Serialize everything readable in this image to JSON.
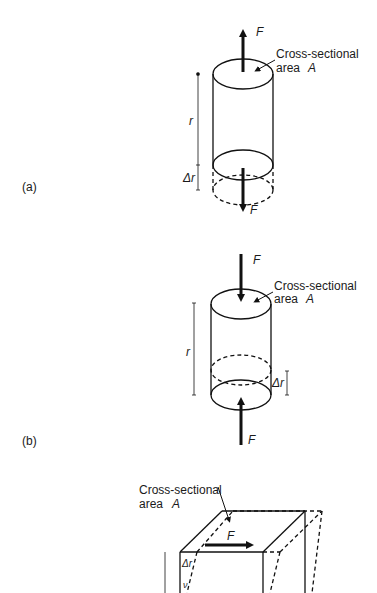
{
  "diagram": {
    "panels": [
      {
        "id": "a",
        "label": "(a)",
        "type": "tension",
        "force_top": "F",
        "force_bottom": "F",
        "area_label_line1": "Cross-sectional",
        "area_label_line2": "area",
        "area_symbol": "A",
        "length_label": "r",
        "delta_label": "Δr"
      },
      {
        "id": "b",
        "label": "(b)",
        "type": "compression",
        "force_top": "F",
        "force_bottom": "F",
        "area_label_line1": "Cross-sectional",
        "area_label_line2": "area",
        "area_symbol": "A",
        "length_label": "r",
        "delta_label": "Δr"
      },
      {
        "id": "c",
        "type": "shear",
        "force": "F",
        "area_label_line1": "Cross-sectional",
        "area_label_line2": "area",
        "area_symbol": "A",
        "delta_label": "Δr",
        "partial_label": "ν"
      }
    ]
  }
}
